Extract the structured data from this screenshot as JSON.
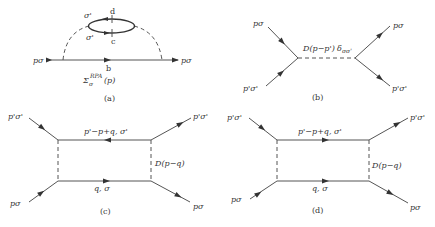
{
  "figure": {
    "colors": {
      "line": "#555555",
      "text": "#333333",
      "background": "#ffffff"
    },
    "panels": [
      {
        "id": "a",
        "caption": "(a)",
        "labels": {
          "left_leg": "pσ",
          "right_leg": "pσ",
          "bubble_top_spin": "σ'",
          "bubble_bottom_spin": "σ'",
          "bubble_top": "d",
          "bubble_bottom": "c",
          "propagator": "b",
          "self_energy_base": "Σ",
          "self_energy_sub": "σ",
          "self_energy_sup": "RPA",
          "self_energy_arg": "(p)"
        }
      },
      {
        "id": "b",
        "caption": "(b)",
        "labels": {
          "upper_left": "pσ",
          "lower_left": "p'σ'",
          "upper_right": "pσ",
          "lower_right": "p'σ'",
          "interaction": "D(p−p')",
          "delta": "δ",
          "delta_sub": "σσ'"
        }
      },
      {
        "id": "c",
        "caption": "(c)",
        "labels": {
          "upper_left": "p'σ'",
          "upper_right": "p'σ'",
          "lower_left": "pσ",
          "lower_right": "pσ",
          "top_line": "p'−p+q, σ'",
          "bottom_line": "q, σ",
          "interaction": "D(p−q)"
        },
        "top_arrow_direction": "left"
      },
      {
        "id": "d",
        "caption": "(d)",
        "labels": {
          "upper_left": "p'σ'",
          "upper_right": "p'σ'",
          "lower_left": "pσ",
          "lower_right": "pσ",
          "top_line": "p'−p+q, σ'",
          "bottom_line": "q, σ",
          "interaction": "D(p−q)"
        },
        "top_arrow_direction": "right"
      }
    ]
  }
}
